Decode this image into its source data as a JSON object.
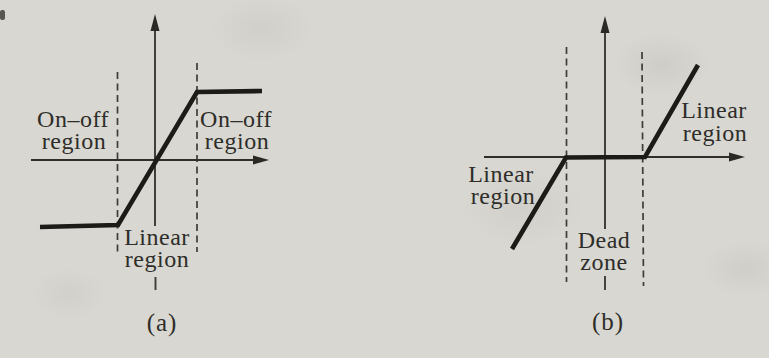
{
  "colors": {
    "paper": "#d8d7d2",
    "ink": "#1c1b18",
    "text": "#2e2d29"
  },
  "diagram_a": {
    "caption": "(a)",
    "curve_points": "40,227 118,225 197,92 262,91",
    "labels": {
      "left_line1": "On–off",
      "left_line2": "region",
      "right_line1": "On–off",
      "right_line2": "region",
      "bottom_line1": "Linear",
      "bottom_line2": "region"
    }
  },
  "diagram_b": {
    "caption": "(b)",
    "curve_points": "512,249 566,157.5 645,157 698,65",
    "labels": {
      "left_line1": "Linear",
      "left_line2": "region",
      "right_line1": "Linear",
      "right_line2": "region",
      "center_line1": "Dead",
      "center_line2": "zone"
    }
  }
}
